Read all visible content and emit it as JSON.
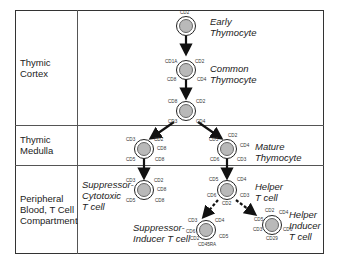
{
  "regions": [
    {
      "label": "Thymic\nCortex"
    },
    {
      "label": "Thymic\nMedulla"
    },
    {
      "label": "Peripheral\nBlood, T Cell\nCompartment"
    }
  ],
  "cells": {
    "early_thymocyte": {
      "name": "Early\nThymocyte",
      "markers": [
        "CD2"
      ]
    },
    "common_thymocyte": {
      "name": "Common\nThymocyte",
      "markers": [
        "CD1A",
        "CD2",
        "CD8",
        "CD4"
      ]
    },
    "late_cortical": {
      "markers": [
        "CD8",
        "CD2",
        "CD3",
        "CD4"
      ]
    },
    "medulla_cd8": {
      "markers": [
        "CD3",
        "CD2",
        "CD8",
        "CD5",
        "CD8"
      ]
    },
    "mature_thymocyte": {
      "name": "Mature\nThymocyte",
      "markers": [
        "CD5",
        "CD2",
        "CD4",
        "CD6",
        "CD3"
      ]
    },
    "suppressor_cytotoxic": {
      "name": "Suppressor-\nCytotoxic\nT cell",
      "markers": [
        "CD3",
        "CD2",
        "CD8",
        "CD5",
        "CD8"
      ]
    },
    "helper_t": {
      "name": "Helper\nT cell",
      "markers": [
        "CD5",
        "CD4",
        "CD6",
        "CD3",
        "CD2"
      ]
    },
    "suppressor_inducer": {
      "name": "Suppressor-\nInducer T cell",
      "markers": [
        "CD3",
        "CD4",
        "CD6",
        "CD5",
        "CD2",
        "CD45RA"
      ]
    },
    "helper_inducer": {
      "name": "Helper\nInducer\nT cell",
      "markers": [
        "CD2",
        "CD4",
        "CD5",
        "CD3",
        "CD6",
        "CD29"
      ]
    }
  }
}
